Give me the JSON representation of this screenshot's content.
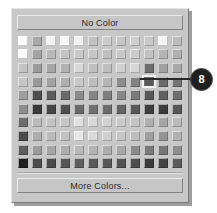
{
  "panel": {
    "name": "color-picker-dropdown",
    "background": "#c8c8c8"
  },
  "no_color_button": {
    "label": "No Color"
  },
  "more_colors_button": {
    "label": "More Colors..."
  },
  "callout": {
    "number": "8",
    "badge_color": "#1f1f1f",
    "leader_color": "#2a2a2a"
  },
  "swatch_grid": {
    "columns": 12,
    "rows": 10,
    "selected_index": 45,
    "colors": [
      "#ffffff",
      "#a8a8a8",
      "#f4f4f4",
      "#f8f8f8",
      "#f2f2f2",
      "#c2c2c2",
      "#cccccc",
      "#c6c6c6",
      "#cfcfcf",
      "#c9c9c9",
      "#f6f6f6",
      "#bcbcbc",
      "#fbfbfb",
      "#a4a4a4",
      "#b8b8b8",
      "#c4c4c4",
      "#cacaca",
      "#c6c6c6",
      "#c0c0c0",
      "#c8c8c8",
      "#cdcdcd",
      "#c2c2c2",
      "#b4b4b4",
      "#b0b0b0",
      "#c4c4c4",
      "#9c9c9c",
      "#a6a6a6",
      "#b2b2b2",
      "#d8d8d8",
      "#c0c0c0",
      "#bebebe",
      "#d0d0d0",
      "#d6d6d6",
      "#6e6e6e",
      "#a0a0a0",
      "#a8a8a8",
      "#c6c6c6",
      "#9a9a9a",
      "#a2a2a2",
      "#aeaeae",
      "#c8c8c8",
      "#bdbdbd",
      "#b6b6b6",
      "#8e8e8e",
      "#828282",
      "#5a5a5a",
      "#6a6a6a",
      "#747474",
      "#9e9e9e",
      "#4e4e4e",
      "#5c5c5c",
      "#6a6a6a",
      "#8c8c8c",
      "#868686",
      "#7e7e7e",
      "#888888",
      "#7a7a7a",
      "#585858",
      "#606060",
      "#6e6e6e",
      "#8e8e8e",
      "#3a3a3a",
      "#454545",
      "#505050",
      "#6a6a6a",
      "#707070",
      "#6c6c6c",
      "#646464",
      "#5a5a5a",
      "#3e3e3e",
      "#3c3c3c",
      "#565656",
      "#6e6e6e",
      "#bcbcbc",
      "#c4c4c4",
      "#c8c8c8",
      "#e2e2e2",
      "#d8d8d8",
      "#d2d2d2",
      "#cacaca",
      "#c4c4c4",
      "#b0b0b0",
      "#a6a6a6",
      "#bababa",
      "#4a4a4a",
      "#aeaeae",
      "#bababa",
      "#c2c2c2",
      "#e8e8e8",
      "#dadada",
      "#d0d0d0",
      "#c6c6c6",
      "#bebebe",
      "#9e9e9e",
      "#949494",
      "#b2b2b2",
      "#5e5e5e",
      "#9c9c9c",
      "#a6a6a6",
      "#aeaeae",
      "#b8b8b8",
      "#b4b4b4",
      "#aeaeae",
      "#a8a8a8",
      "#8c8c8c",
      "#7a7a7a",
      "#767676",
      "#8e8e8e",
      "#1e1e1e",
      "#4c4c4c",
      "#4a4a4a",
      "#565656",
      "#5e5e5e",
      "#5a5a5a",
      "#585858",
      "#545454",
      "#4e4e4e",
      "#3a3a3a",
      "#424242",
      "#5a5a5a"
    ]
  }
}
